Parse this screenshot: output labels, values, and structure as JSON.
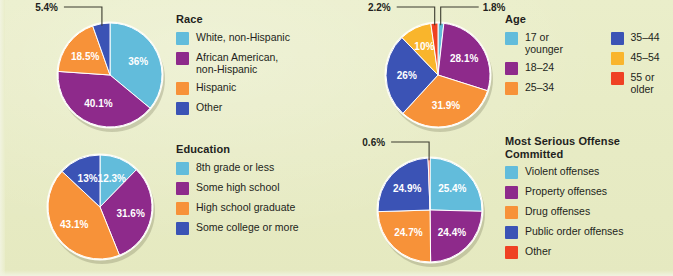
{
  "page": {
    "background_color": "#e9edc9",
    "text_color": "#231f20"
  },
  "palette": {
    "light_blue": "#62bcdb",
    "purple": "#8e2a8b",
    "orange": "#f79239",
    "blue": "#3b53b5",
    "yellow": "#f9b52c",
    "red": "#ef4123",
    "white": "#ffffff"
  },
  "charts": [
    {
      "id": "race",
      "title": "Race",
      "legend_columns": 1,
      "chart_data": {
        "type": "pie",
        "title": "Race",
        "categories": [
          "White, non-Hispanic",
          "African American,\nnon-Hispanic",
          "Hispanic",
          "Other"
        ],
        "values": [
          36,
          40.1,
          18.5,
          5.4
        ],
        "labels": [
          "36%",
          "40.1%",
          "18.5%",
          "5.4%"
        ],
        "colors": [
          "#62bcdb",
          "#8e2a8b",
          "#f79239",
          "#3b53b5"
        ],
        "callouts": [
          {
            "label": "5.4%",
            "slice_index": 3
          }
        ],
        "legend_position": "right",
        "grid": false
      }
    },
    {
      "id": "age",
      "title": "Age",
      "legend_columns": 2,
      "chart_data": {
        "type": "pie",
        "title": "Age",
        "categories": [
          "17 or younger",
          "18–24",
          "25–34",
          "35–44",
          "45–54",
          "55 or older"
        ],
        "values": [
          1.8,
          28.1,
          31.9,
          26,
          10,
          2.2
        ],
        "labels": [
          "1.8%",
          "28.1%",
          "31.9%",
          "26%",
          "10%",
          "2.2%"
        ],
        "colors": [
          "#62bcdb",
          "#8e2a8b",
          "#f79239",
          "#3b53b5",
          "#f9b52c",
          "#ef4123"
        ],
        "callouts": [
          {
            "label": "2.2%",
            "slice_index": 5
          },
          {
            "label": "1.8%",
            "slice_index": 0
          }
        ],
        "legend_position": "right",
        "grid": false
      }
    },
    {
      "id": "education",
      "title": "Education",
      "legend_columns": 1,
      "chart_data": {
        "type": "pie",
        "title": "Education",
        "categories": [
          "8th grade or less",
          "Some high school",
          "High school graduate",
          "Some college or more"
        ],
        "values": [
          12.3,
          31.6,
          43.1,
          13
        ],
        "labels": [
          "12.3%",
          "31.6%",
          "43.1%",
          "13%"
        ],
        "colors": [
          "#62bcdb",
          "#8e2a8b",
          "#f79239",
          "#3b53b5"
        ],
        "callouts": [],
        "legend_position": "right",
        "grid": false
      }
    },
    {
      "id": "offense",
      "title": "Most Serious Offense\nCommitted",
      "legend_columns": 1,
      "chart_data": {
        "type": "pie",
        "title": "Most Serious Offense Committed",
        "categories": [
          "Violent offenses",
          "Property offenses",
          "Drug offenses",
          "Public order offenses",
          "Other"
        ],
        "values": [
          25.4,
          24.4,
          24.7,
          24.9,
          0.6
        ],
        "labels": [
          "25.4%",
          "24.4%",
          "24.7%",
          "24.9%",
          "0.6%"
        ],
        "colors": [
          "#62bcdb",
          "#8e2a8b",
          "#f79239",
          "#3b53b5",
          "#ef4123"
        ],
        "callouts": [
          {
            "label": "0.6%",
            "slice_index": 4
          }
        ],
        "legend_position": "right",
        "grid": false
      }
    }
  ],
  "layout": {
    "race": {
      "cx": 110,
      "cy": 75,
      "r": 52,
      "legend_x": 176,
      "legend_y": 13
    },
    "age": {
      "cx": 438,
      "cy": 75,
      "r": 52,
      "legend_x": 505,
      "legend_y": 13
    },
    "education": {
      "cx": 100,
      "cy": 207,
      "r": 52,
      "legend_x": 176,
      "legend_y": 143
    },
    "offense": {
      "cx": 430,
      "cy": 210,
      "r": 52,
      "legend_x": 505,
      "legend_y": 135
    }
  }
}
